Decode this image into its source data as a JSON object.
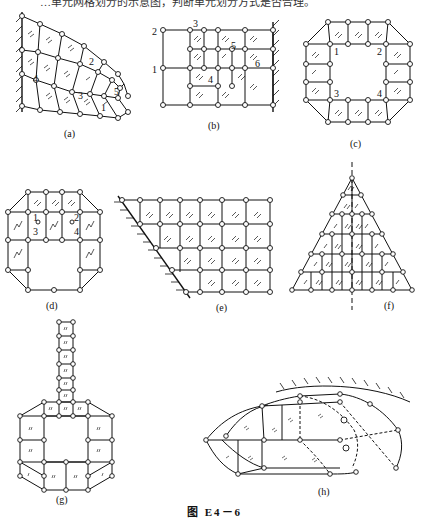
{
  "header": {
    "text": "…单元网格划分的示意图，判断单元划分方式是否合理。"
  },
  "figure": {
    "caption": "图   E4－6",
    "panels": [
      {
        "id": "a",
        "label": "(a)",
        "node_numbers": [
          "1",
          "2",
          "3",
          "4",
          "5"
        ]
      },
      {
        "id": "b",
        "label": "(b)",
        "node_numbers": [
          "1",
          "2",
          "3",
          "4",
          "5",
          "6"
        ]
      },
      {
        "id": "c",
        "label": "(c)",
        "node_numbers": [
          "1",
          "2",
          "3",
          "4"
        ]
      },
      {
        "id": "d",
        "label": "(d)",
        "node_numbers": [
          "1",
          "2",
          "3",
          "4"
        ]
      },
      {
        "id": "e",
        "label": "(e)",
        "node_numbers": []
      },
      {
        "id": "f",
        "label": "(f)",
        "node_numbers": []
      },
      {
        "id": "g",
        "label": "(g)",
        "node_numbers": []
      },
      {
        "id": "h",
        "label": "(h)",
        "node_numbers": []
      }
    ]
  },
  "colors": {
    "ink": "#111111",
    "background": "#ffffff"
  }
}
